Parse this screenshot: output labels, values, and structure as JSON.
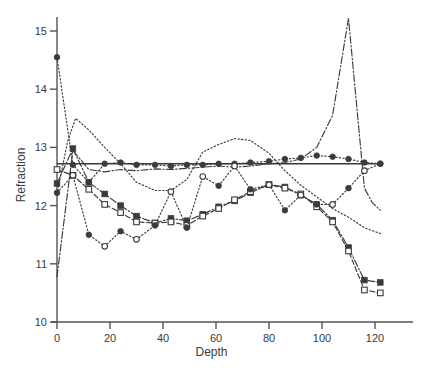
{
  "chart_data": {
    "type": "line",
    "title": "",
    "xlabel": "Depth",
    "ylabel": "Refraction",
    "xlim": [
      -3,
      130
    ],
    "ylim": [
      10,
      15.35
    ],
    "xticks": [
      0,
      20,
      40,
      60,
      80,
      100,
      120
    ],
    "yticks": [
      10,
      11,
      12,
      13,
      14,
      15
    ],
    "grid": false,
    "legend": "none",
    "reference_line": {
      "type": "horizontal",
      "y": 12.72,
      "style": "solid",
      "x_start": 0,
      "x_end": 122
    },
    "series": [
      {
        "name": "series-1-dotted-spike",
        "style": "dash-dot",
        "marker": "none",
        "points": [
          [
            0,
            10.78
          ],
          [
            6,
            12.95
          ],
          [
            12,
            12.62
          ],
          [
            18,
            12.58
          ],
          [
            24,
            12.62
          ],
          [
            30,
            12.6
          ],
          [
            37,
            12.63
          ],
          [
            43,
            12.62
          ],
          [
            49,
            12.64
          ],
          [
            55,
            12.66
          ],
          [
            61,
            12.68
          ],
          [
            67,
            12.66
          ],
          [
            73,
            12.68
          ],
          [
            80,
            12.72
          ],
          [
            86,
            12.74
          ],
          [
            92,
            12.8
          ],
          [
            98,
            13.0
          ],
          [
            104,
            13.55
          ],
          [
            110,
            15.22
          ],
          [
            116,
            12.3
          ],
          [
            119,
            12.05
          ],
          [
            122,
            11.92
          ]
        ]
      },
      {
        "name": "series-2-dotted-descend",
        "style": "dotted",
        "marker": "filled-circle",
        "points": [
          [
            0,
            14.55
          ],
          [
            6,
            12.7
          ],
          [
            12,
            12.4
          ],
          [
            18,
            12.72
          ],
          [
            24,
            12.74
          ],
          [
            30,
            12.7
          ],
          [
            37,
            12.7
          ],
          [
            43,
            12.68
          ],
          [
            49,
            12.7
          ],
          [
            55,
            12.7
          ],
          [
            61,
            12.72
          ],
          [
            67,
            12.72
          ],
          [
            73,
            12.74
          ],
          [
            80,
            12.76
          ],
          [
            86,
            12.8
          ],
          [
            92,
            12.82
          ],
          [
            98,
            12.86
          ],
          [
            104,
            12.84
          ],
          [
            110,
            12.8
          ],
          [
            116,
            12.74
          ],
          [
            122,
            12.72
          ]
        ]
      },
      {
        "name": "series-3-dotted-hump",
        "style": "dotted",
        "marker": "none",
        "points": [
          [
            0,
            12.2
          ],
          [
            4,
            13.1
          ],
          [
            7,
            13.5
          ],
          [
            12,
            13.3
          ],
          [
            18,
            13.0
          ],
          [
            24,
            12.72
          ],
          [
            30,
            12.4
          ],
          [
            37,
            12.26
          ],
          [
            43,
            12.26
          ],
          [
            49,
            12.45
          ],
          [
            55,
            12.92
          ],
          [
            61,
            13.05
          ],
          [
            67,
            13.15
          ],
          [
            73,
            13.12
          ],
          [
            80,
            12.9
          ],
          [
            86,
            12.6
          ],
          [
            92,
            12.35
          ],
          [
            98,
            12.15
          ],
          [
            104,
            11.95
          ],
          [
            110,
            11.8
          ],
          [
            116,
            11.62
          ],
          [
            122,
            11.52
          ]
        ]
      },
      {
        "name": "series-4-dashdot-filled-square",
        "style": "dash-dot",
        "marker": "filled-square",
        "points": [
          [
            0,
            12.38
          ],
          [
            6,
            12.98
          ],
          [
            12,
            12.4
          ],
          [
            18,
            12.2
          ],
          [
            24,
            12.0
          ],
          [
            30,
            11.82
          ],
          [
            37,
            11.7
          ],
          [
            43,
            11.78
          ],
          [
            49,
            11.74
          ],
          [
            55,
            11.85
          ],
          [
            61,
            11.98
          ],
          [
            67,
            12.08
          ],
          [
            73,
            12.22
          ],
          [
            80,
            12.36
          ],
          [
            86,
            12.32
          ],
          [
            92,
            12.18
          ],
          [
            98,
            12.02
          ],
          [
            104,
            11.75
          ],
          [
            110,
            11.28
          ],
          [
            116,
            10.72
          ],
          [
            122,
            10.68
          ]
        ]
      },
      {
        "name": "series-5-dashed-open-square",
        "style": "dashed",
        "marker": "open-square",
        "points": [
          [
            0,
            12.62
          ],
          [
            6,
            12.52
          ],
          [
            12,
            12.28
          ],
          [
            18,
            12.02
          ],
          [
            24,
            11.88
          ],
          [
            30,
            11.72
          ],
          [
            37,
            11.7
          ],
          [
            43,
            11.72
          ],
          [
            49,
            11.66
          ],
          [
            55,
            11.82
          ],
          [
            61,
            11.95
          ],
          [
            67,
            12.1
          ],
          [
            73,
            12.24
          ],
          [
            80,
            12.36
          ],
          [
            86,
            12.3
          ],
          [
            92,
            12.2
          ],
          [
            98,
            11.98
          ],
          [
            104,
            11.72
          ],
          [
            110,
            11.22
          ],
          [
            116,
            10.55
          ],
          [
            122,
            10.5
          ]
        ]
      },
      {
        "name": "series-6-dotted-open-circle",
        "style": "dotted",
        "marker": "mixed-circle",
        "points": [
          [
            0,
            12.22
          ],
          [
            6,
            12.52
          ],
          [
            12,
            11.5
          ],
          [
            18,
            11.3
          ],
          [
            24,
            11.56
          ],
          [
            30,
            11.42
          ],
          [
            37,
            11.66
          ],
          [
            43,
            12.24
          ],
          [
            49,
            11.62
          ],
          [
            55,
            12.5
          ],
          [
            61,
            12.34
          ],
          [
            67,
            12.68
          ],
          [
            73,
            12.28
          ],
          [
            80,
            12.36
          ],
          [
            86,
            11.92
          ],
          [
            92,
            12.18
          ],
          [
            98,
            12.02
          ],
          [
            104,
            12.02
          ],
          [
            110,
            12.3
          ],
          [
            116,
            12.6
          ],
          [
            122,
            12.72
          ]
        ]
      }
    ]
  },
  "axis": {
    "y_tick_labels": [
      "15",
      "14",
      "13",
      "12",
      "11",
      "10"
    ],
    "x_tick_labels": [
      "0",
      "20",
      "40",
      "60",
      "80",
      "100",
      "120"
    ],
    "y_title": "Refraction",
    "x_title": "Depth"
  },
  "colors": {
    "ink": "#3b3b3b",
    "axis": "#555555",
    "background": "#ffffff"
  }
}
